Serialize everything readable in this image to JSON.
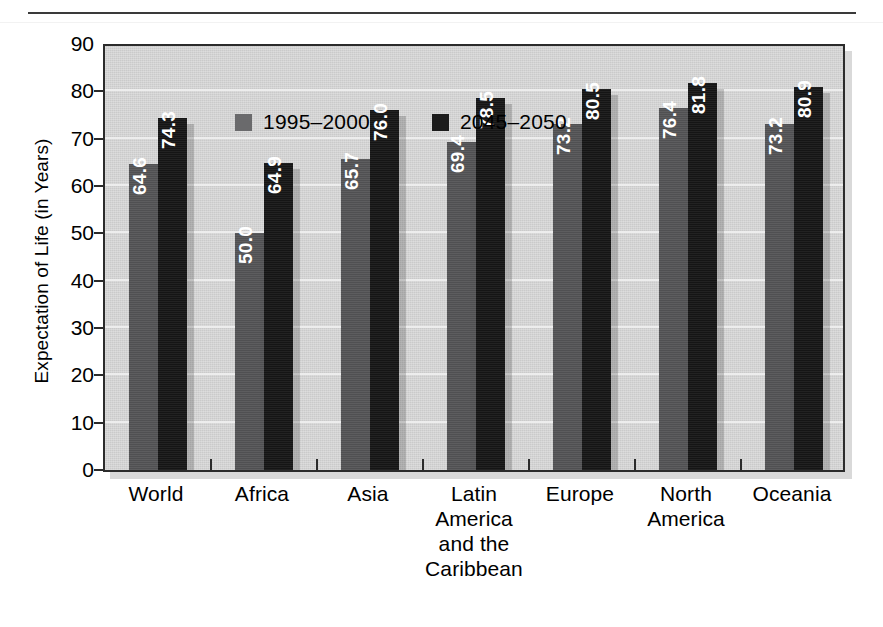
{
  "page": {
    "rule_present": true,
    "top_fragment": ""
  },
  "chart_data": {
    "type": "bar",
    "title": "",
    "xlabel": "",
    "ylabel": "Expectation of Life (in Years)",
    "ylim": [
      0,
      90
    ],
    "ytick_step": 10,
    "yticks": [
      "90",
      "80",
      "70",
      "60",
      "50",
      "40",
      "30",
      "20",
      "10",
      "0"
    ],
    "grid": true,
    "legend_position": "top-left-inside",
    "categories": [
      "World",
      "Africa",
      "Asia",
      "Latin America and the Caribbean",
      "Europe",
      "North America",
      "Oceania"
    ],
    "category_lines": [
      [
        "World"
      ],
      [
        "Africa"
      ],
      [
        "Asia"
      ],
      [
        "Latin",
        "America",
        "and the",
        "Caribbean"
      ],
      [
        "Europe"
      ],
      [
        "North",
        "America"
      ],
      [
        "Oceania"
      ]
    ],
    "series": [
      {
        "name": "1995–2000",
        "color": "#545456",
        "values": [
          64.6,
          50.0,
          65.7,
          69.4,
          73.2,
          76.4,
          73.2
        ],
        "labels": [
          "64.6",
          "50.0",
          "65.7",
          "69.4",
          "73.2",
          "76.4",
          "73.2"
        ]
      },
      {
        "name": "2045–2050",
        "color": "#161616",
        "values": [
          74.3,
          64.9,
          76.0,
          78.5,
          80.5,
          81.8,
          80.9
        ],
        "labels": [
          "74.3",
          "64.9",
          "76.0",
          "78.5",
          "80.5",
          "81.8",
          "80.9"
        ]
      }
    ],
    "colors": {
      "plot_background": "#d2d2d2",
      "gridline": "#ededed",
      "axis": "#2b2b2b",
      "series_1": "#545456",
      "series_2": "#161616",
      "value_label": "#ffffff"
    }
  }
}
